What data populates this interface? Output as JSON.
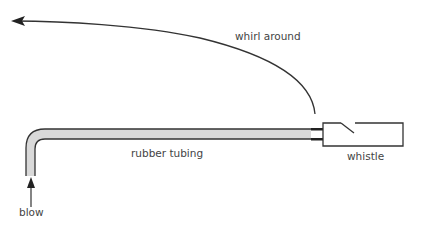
{
  "diagram": {
    "labels": {
      "whirl": "whirl around",
      "tubing": "rubber tubing",
      "whistle": "whistle",
      "blow": "blow"
    },
    "colors": {
      "stroke": "#333333",
      "tube_fill": "#d9d9d9",
      "text": "#444444"
    }
  }
}
